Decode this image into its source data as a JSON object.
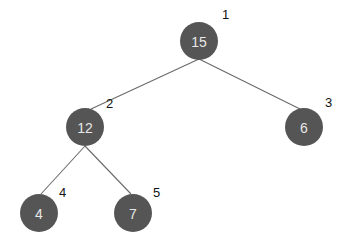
{
  "diagram": {
    "type": "binary-tree",
    "colors": {
      "node_fill": "#555555",
      "node_text": "#e8e8e8",
      "index_text": "#111111",
      "edge": "#6a6a6a",
      "background": "#ffffff"
    },
    "node_radius": 19,
    "nodes": [
      {
        "id": "n1",
        "value": "15",
        "index": "1",
        "cx": 199,
        "cy": 41,
        "lx": 222,
        "ly": 19
      },
      {
        "id": "n2",
        "value": "12",
        "index": "2",
        "cx": 85,
        "cy": 127,
        "lx": 106,
        "ly": 108
      },
      {
        "id": "n3",
        "value": "6",
        "index": "3",
        "cx": 304,
        "cy": 127,
        "lx": 325,
        "ly": 107
      },
      {
        "id": "n4",
        "value": "4",
        "index": "4",
        "cx": 39,
        "cy": 213,
        "lx": 59,
        "ly": 197
      },
      {
        "id": "n5",
        "value": "7",
        "index": "5",
        "cx": 133,
        "cy": 213,
        "lx": 153,
        "ly": 197
      }
    ],
    "edges": [
      {
        "from": "n1",
        "to": "n2",
        "x1": 199,
        "y1": 59,
        "x2": 91,
        "y2": 109
      },
      {
        "from": "n1",
        "to": "n3",
        "x1": 199,
        "y1": 59,
        "x2": 300,
        "y2": 109
      },
      {
        "from": "n2",
        "to": "n4",
        "x1": 85,
        "y1": 146,
        "x2": 41,
        "y2": 194
      },
      {
        "from": "n2",
        "to": "n5",
        "x1": 85,
        "y1": 146,
        "x2": 131,
        "y2": 194
      }
    ]
  }
}
